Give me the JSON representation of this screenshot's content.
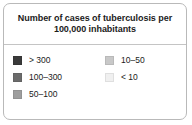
{
  "legend": {
    "title": "Number of cases of tuberculosis per\n100,000 inhabitants",
    "title_line1": "Number of cases of tuberculosis per",
    "title_line2": "100,000 inhabitants",
    "panel": {
      "background_color": "#ffffff",
      "border_color": "#b9b9b9",
      "divider_color": "#c4c4c4",
      "text_color": "#1b1b1b"
    },
    "columns": [
      {
        "name": "left",
        "items": [
          {
            "label": "> 300",
            "color": "#3a3a3a"
          },
          {
            "label": "100–300",
            "color": "#6b6b6b"
          },
          {
            "label": "50–100",
            "color": "#9e9e9e"
          }
        ]
      },
      {
        "name": "right",
        "items": [
          {
            "label": "10–50",
            "color": "#c8c8c8"
          },
          {
            "label": "< 10",
            "color": "#f0f0f0"
          }
        ]
      }
    ]
  },
  "chart_data": {
    "type": "table",
    "title": "Number of cases of tuberculosis per 100,000 inhabitants",
    "xlabel": "",
    "ylabel": "",
    "legend_position": "standalone",
    "grid": false,
    "categories": [
      "> 300",
      "100–300",
      "50–100",
      "10–50",
      "< 10"
    ],
    "colors": [
      "#3a3a3a",
      "#6b6b6b",
      "#9e9e9e",
      "#c8c8c8",
      "#f0f0f0"
    ],
    "series": [
      {
        "name": "Cases per 100,000 inhabitants (class bounds)",
        "classes": [
          {
            "label": "> 300",
            "min": 300,
            "max": null,
            "color": "#3a3a3a"
          },
          {
            "label": "100–300",
            "min": 100,
            "max": 300,
            "color": "#6b6b6b"
          },
          {
            "label": "50–100",
            "min": 50,
            "max": 100,
            "color": "#9e9e9e"
          },
          {
            "label": "10–50",
            "min": 10,
            "max": 50,
            "color": "#c8c8c8"
          },
          {
            "label": "< 10",
            "min": null,
            "max": 10,
            "color": "#f0f0f0"
          }
        ]
      }
    ]
  }
}
